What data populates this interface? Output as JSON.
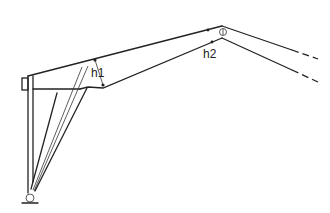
{
  "diagram": {
    "type": "structural-frame-sketch",
    "labels": {
      "h1": "h1",
      "h2": "h2"
    },
    "elements": [
      "column-with-tapered-struts",
      "pin-support",
      "upper-chord",
      "lower-chord",
      "hinge-joint",
      "dashed-continuation"
    ]
  }
}
